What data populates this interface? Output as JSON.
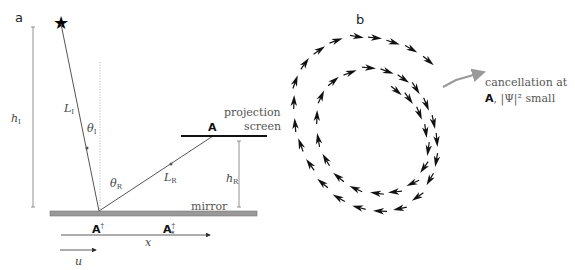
{
  "panel_a": {
    "label": "a",
    "source_marker": "★",
    "heights": {
      "h_incident": "h",
      "h_incident_sub": "I",
      "h_reflected": "h",
      "h_reflected_sub": "R"
    },
    "lengths": {
      "L_incident": "L",
      "L_incident_sub": "I",
      "L_reflected": "L",
      "L_reflected_sub": "R"
    },
    "angles": {
      "theta_incident": "θ",
      "theta_incident_sub": "I",
      "theta_reflected": "θ",
      "theta_reflected_sub": "R"
    },
    "screen_label_line1": "projection",
    "screen_label_line2": "screen",
    "screen_point": "A",
    "mirror_label": "mirror",
    "mirror_point": "A",
    "mirror_point_sup": "†",
    "mirror_point_star": "A",
    "mirror_point_star_sup": "†",
    "mirror_point_star_sub": "*",
    "axis_x": "x",
    "axis_u": "u"
  },
  "panel_b": {
    "label": "b",
    "annotation_line1": "cancellation at",
    "annotation_point": "A",
    "annotation_line2_rest": ", |Ψ|² small"
  },
  "colors": {
    "line": "#555555",
    "mirror": "#999999",
    "annotation_arrow": "#999999",
    "arrow_fill": "#111111"
  }
}
